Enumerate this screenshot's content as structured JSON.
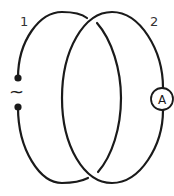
{
  "diagram": {
    "loops": [
      {
        "id": "1",
        "label": "1",
        "element": "ac-source",
        "element_symbol": "~"
      },
      {
        "id": "2",
        "label": "2",
        "element": "ammeter",
        "element_symbol": "A"
      }
    ],
    "colors": {
      "wire": "#1a1a1a",
      "label": "#333333",
      "background": "#ffffff"
    }
  }
}
